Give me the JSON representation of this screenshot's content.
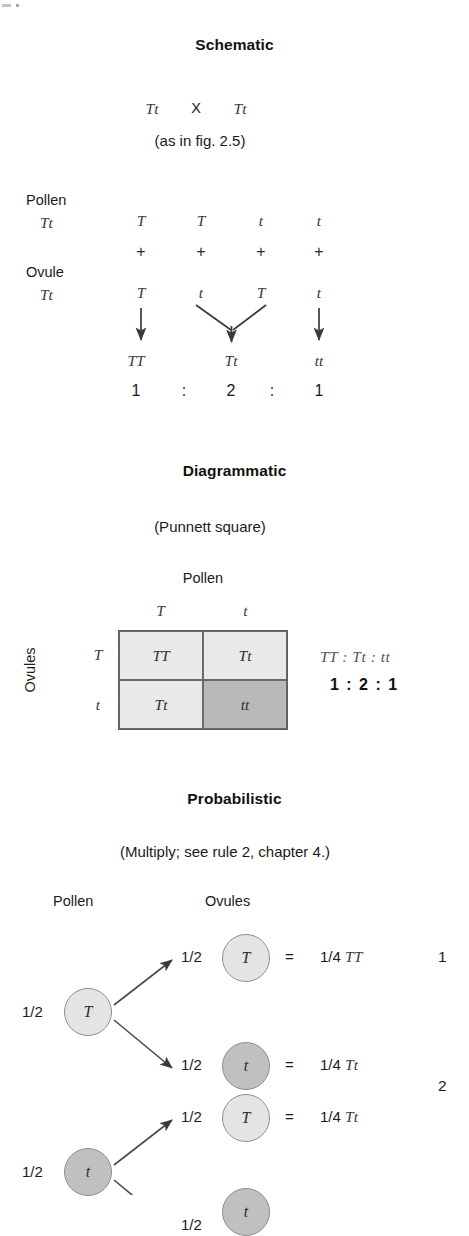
{
  "figure": {
    "sections": [
      "Schematic",
      "Diagrammatic",
      "Probabilistic"
    ]
  },
  "schematic": {
    "title": "Schematic",
    "cross_left": "Tt",
    "cross_symbol": "X",
    "cross_right": "Tt",
    "reference_note": "(as in fig. 2.5)",
    "pollen_label": "Pollen",
    "pollen_genotype": "Tt",
    "ovule_label": "Ovule",
    "ovule_genotype": "Tt",
    "pollen_gametes": [
      "T",
      "T",
      "t",
      "t"
    ],
    "plus_signs": [
      "+",
      "+",
      "+",
      "+"
    ],
    "ovule_gametes": [
      "T",
      "t",
      "T",
      "t"
    ],
    "offspring": [
      "TT",
      "Tt",
      "tt"
    ],
    "ratio_numbers": [
      "1",
      "2",
      "1"
    ],
    "ratio_colons": [
      ":",
      ":"
    ]
  },
  "diagrammatic": {
    "title": "Diagrammatic",
    "subtitle": "(Punnett square)",
    "top_axis_label": "Pollen",
    "side_axis_label": "Ovules",
    "column_headers": [
      "T",
      "t"
    ],
    "row_headers": [
      "T",
      "t"
    ],
    "cells": [
      {
        "value": "TT",
        "shade": "light"
      },
      {
        "value": "Tt",
        "shade": "light"
      },
      {
        "value": "Tt",
        "shade": "light"
      },
      {
        "value": "tt",
        "shade": "dark"
      }
    ],
    "ratio_genotypes": "TT  :  Tt  :  tt",
    "ratio_values": "1  :  2  :  1"
  },
  "probabilistic": {
    "title": "Probabilistic",
    "subtitle": "(Multiply; see rule 2, chapter 4.)",
    "pollen_header": "Pollen",
    "ovules_header": "Ovules",
    "parents": [
      {
        "probability": "1/2",
        "allele": "T",
        "shade": "light"
      },
      {
        "probability": "1/2",
        "allele": "t",
        "shade": "dark"
      }
    ],
    "branches": [
      {
        "probability": "1/2",
        "allele": "T",
        "shade": "light",
        "equals": "=",
        "result_prob": "1/4",
        "result_genotype": "TT"
      },
      {
        "probability": "1/2",
        "allele": "t",
        "shade": "dark",
        "equals": "=",
        "result_prob": "1/4",
        "result_genotype": "Tt"
      },
      {
        "probability": "1/2",
        "allele": "T",
        "shade": "light",
        "equals": "=",
        "result_prob": "1/4",
        "result_genotype": "Tt"
      },
      {
        "probability": "1/2",
        "allele": "t",
        "shade": "dark",
        "equals": "=",
        "result_prob": "1/4",
        "result_genotype": "tt"
      }
    ],
    "summary_numbers": [
      "1",
      "2"
    ]
  },
  "colors": {
    "cell_light": "#e9e9e9",
    "cell_dark": "#b9b9b9",
    "node_light": "#e4e4e4",
    "node_dark": "#c0c0c0",
    "stroke": "#5d5d5d",
    "text": "#1a1a1a"
  }
}
